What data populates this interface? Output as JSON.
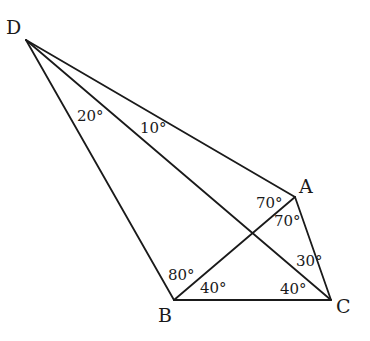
{
  "diagram": {
    "type": "geometry",
    "vertices": {
      "D": {
        "label": "D",
        "x": 26,
        "y": 40,
        "label_x": 6,
        "label_y": 34
      },
      "A": {
        "label": "A",
        "x": 295,
        "y": 197,
        "label_x": 299,
        "label_y": 193
      },
      "B": {
        "label": "B",
        "x": 174,
        "y": 300,
        "label_x": 158,
        "label_y": 322
      },
      "C": {
        "label": "C",
        "x": 331,
        "y": 300,
        "label_x": 336,
        "label_y": 313
      }
    },
    "edges": [
      {
        "from": "D",
        "to": "B"
      },
      {
        "from": "D",
        "to": "C"
      },
      {
        "from": "D",
        "to": "A"
      },
      {
        "from": "A",
        "to": "B"
      },
      {
        "from": "A",
        "to": "C"
      },
      {
        "from": "B",
        "to": "C"
      }
    ],
    "angles": [
      {
        "text": "20°",
        "x": 77,
        "y": 121,
        "note": "angle BDC at D"
      },
      {
        "text": "10°",
        "x": 140,
        "y": 133,
        "note": "angle CDA at D"
      },
      {
        "text": "70°",
        "x": 256,
        "y": 208,
        "note": "angle DAB at A"
      },
      {
        "text": "70°",
        "x": 274,
        "y": 226,
        "note": "angle BAC at A"
      },
      {
        "text": "30°",
        "x": 296,
        "y": 266,
        "note": "angle ACD at C"
      },
      {
        "text": "40°",
        "x": 280,
        "y": 294,
        "note": "angle DCB at C"
      },
      {
        "text": "80°",
        "x": 168,
        "y": 280,
        "note": "angle DBA at B"
      },
      {
        "text": "40°",
        "x": 200,
        "y": 293,
        "note": "angle ABC at B"
      }
    ]
  }
}
